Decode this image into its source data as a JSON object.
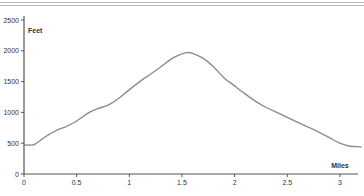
{
  "chart_data": {
    "type": "line",
    "title": "",
    "xlabel": "Miles",
    "ylabel": "Feet",
    "xlim": [
      0,
      3.2
    ],
    "ylim": [
      0,
      2500
    ],
    "x_ticks": [
      0,
      0.5,
      1,
      1.5,
      2,
      2.5,
      3
    ],
    "x_tick_labels": [
      "0",
      "0.5",
      "1",
      "1.5",
      "2",
      "2.5",
      "3"
    ],
    "y_ticks": [
      0,
      500,
      1000,
      1500,
      2000,
      2500
    ],
    "y_tick_labels": [
      "0",
      "500",
      "1000",
      "1500",
      "2000",
      "2500"
    ],
    "grid": false,
    "legend": null,
    "series": [
      {
        "name": "Elevation",
        "color": "#8c8c8c",
        "x": [
          0,
          0.05,
          0.1,
          0.2,
          0.3,
          0.4,
          0.5,
          0.6,
          0.7,
          0.8,
          0.9,
          1.0,
          1.1,
          1.2,
          1.3,
          1.4,
          1.5,
          1.55,
          1.6,
          1.7,
          1.8,
          1.9,
          2.0,
          2.1,
          2.2,
          2.3,
          2.4,
          2.5,
          2.6,
          2.7,
          2.8,
          2.9,
          3.0,
          3.1,
          3.2
        ],
        "values": [
          470,
          470,
          480,
          600,
          700,
          770,
          860,
          980,
          1060,
          1120,
          1230,
          1370,
          1500,
          1620,
          1740,
          1870,
          1950,
          1970,
          1960,
          1880,
          1740,
          1560,
          1430,
          1300,
          1180,
          1080,
          1000,
          920,
          840,
          760,
          680,
          590,
          500,
          450,
          440
        ]
      }
    ]
  },
  "axes": {
    "y_title": "Feet",
    "x_title": "Miles"
  }
}
